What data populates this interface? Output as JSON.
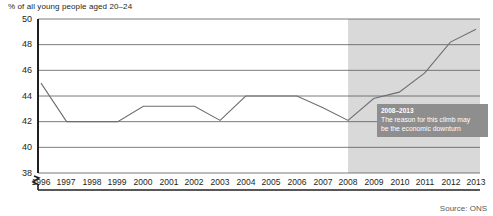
{
  "chart_data": {
    "type": "line",
    "title": "",
    "ylabel": "% of all young people aged 20–24",
    "xlabel": "",
    "ylim": [
      38,
      50
    ],
    "yticks": [
      38,
      40,
      42,
      44,
      46,
      48,
      50
    ],
    "ytick_labels": [
      "38",
      "40",
      "42",
      "44",
      "46",
      "48",
      "50"
    ],
    "axis_break": true,
    "grid": true,
    "legend": false,
    "categories": [
      1996,
      1997,
      1998,
      1999,
      2000,
      2001,
      2002,
      2003,
      2004,
      2005,
      2006,
      2007,
      2008,
      2009,
      2010,
      2011,
      2012,
      2013
    ],
    "xtick_labels": [
      "1996",
      "1997",
      "1998",
      "1999",
      "2000",
      "2001",
      "2002",
      "2003",
      "2004",
      "2005",
      "2006",
      "2007",
      "2008",
      "2009",
      "2010",
      "2011",
      "2012",
      "2013"
    ],
    "series": [
      {
        "name": "Young people aged 20–24 living with parents",
        "color": "#6d6e71",
        "values": [
          45.0,
          42.0,
          42.0,
          42.0,
          43.2,
          43.2,
          43.2,
          42.1,
          44.0,
          44.0,
          44.0,
          43.1,
          42.1,
          43.8,
          44.3,
          45.8,
          48.2,
          49.2
        ]
      }
    ],
    "shaded_region": {
      "from": 2008,
      "to": 2013,
      "color": "#d9d9d9"
    },
    "annotations": [
      {
        "date": "2008–2013",
        "text_line_1": "The reason for this climb may",
        "text_line_2": "be the economic downturn",
        "background": "#8e8e8e",
        "color": "#ffffff"
      }
    ],
    "source": "Source: ONS"
  }
}
